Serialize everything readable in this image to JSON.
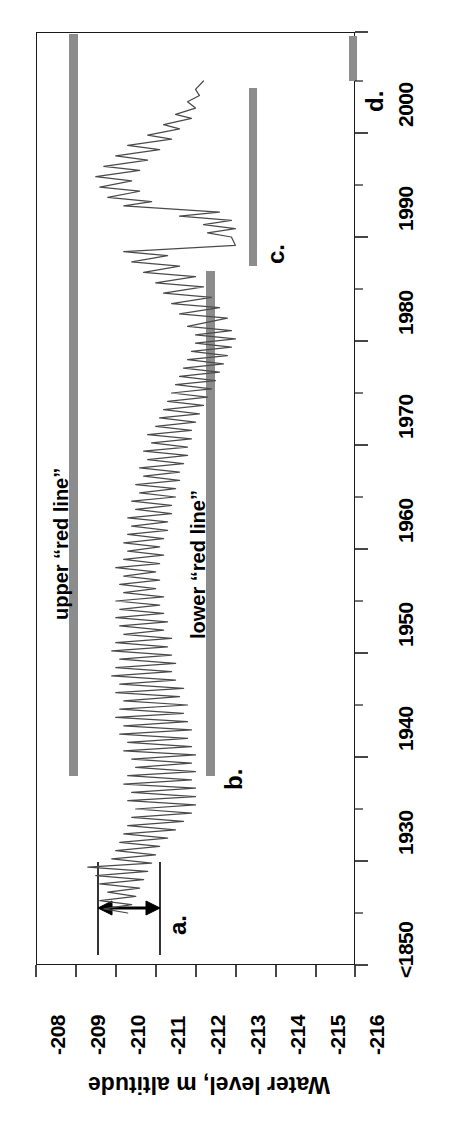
{
  "chart_data": {
    "type": "line",
    "title": "",
    "orientation": "rotated-90-ccw",
    "xlabel": "",
    "ylabel": "Water level, m altitude",
    "x_axis": {
      "name": "year",
      "tick_labels": [
        "<1850",
        "1930",
        "1940",
        "1950",
        "1960",
        "1970",
        "1980",
        "1990",
        "2000"
      ],
      "minor_ticks": true,
      "break_after_first": true
    },
    "y_axis": {
      "name": "Water level, m altitude",
      "tick_labels": [
        "-208",
        "-209",
        "-210",
        "-211",
        "-212",
        "-213",
        "-214",
        "-215",
        "-216"
      ],
      "ylim": [
        -208,
        -216
      ]
    },
    "grid": false,
    "legend": "none",
    "annotations": [
      {
        "key": "a",
        "label": "a.",
        "kind": "double-arrow-span",
        "note": "span marker between two vertical ticks before 1930"
      },
      {
        "key": "b",
        "label": "b.",
        "kind": "bar-end-marker",
        "note": "bottom end of lower red line bar, near 1930"
      },
      {
        "key": "c",
        "label": "c.",
        "kind": "bar-end-marker",
        "note": "bar spanning ~1978 to ~2000"
      },
      {
        "key": "d",
        "label": "d.",
        "kind": "short-bar-marker",
        "note": "short bar at top, after 2000"
      }
    ],
    "series_labels": [
      {
        "id": "upper",
        "text": "upper “red line”",
        "value": -209.0
      },
      {
        "id": "lower",
        "text": "lower “red line”",
        "value": -212.0
      }
    ],
    "series": [
      {
        "name": "Caspian Sea water level",
        "color": "#555555",
        "points": [
          [
            1925.0,
            -210.3
          ],
          [
            1925.4,
            -209.7
          ],
          [
            1925.8,
            -210.4
          ],
          [
            1926.2,
            -209.6
          ],
          [
            1926.6,
            -210.5
          ],
          [
            1927.0,
            -209.8
          ],
          [
            1927.4,
            -210.6
          ],
          [
            1927.8,
            -209.6
          ],
          [
            1928.2,
            -210.7
          ],
          [
            1928.6,
            -209.5
          ],
          [
            1929.0,
            -210.8
          ],
          [
            1929.4,
            -209.3
          ],
          [
            1929.8,
            -210.9
          ],
          [
            1930.2,
            -209.9
          ],
          [
            1930.6,
            -211.0
          ],
          [
            1931.0,
            -210.0
          ],
          [
            1931.4,
            -211.1
          ],
          [
            1931.8,
            -210.1
          ],
          [
            1932.2,
            -211.3
          ],
          [
            1932.6,
            -210.2
          ],
          [
            1933.0,
            -211.5
          ],
          [
            1933.4,
            -210.3
          ],
          [
            1933.8,
            -211.7
          ],
          [
            1934.2,
            -210.4
          ],
          [
            1934.6,
            -211.9
          ],
          [
            1935.0,
            -210.5
          ],
          [
            1935.4,
            -212.0
          ],
          [
            1935.8,
            -210.3
          ],
          [
            1936.2,
            -212.0
          ],
          [
            1936.6,
            -210.4
          ],
          [
            1937.0,
            -212.0
          ],
          [
            1937.4,
            -210.2
          ],
          [
            1937.8,
            -211.9
          ],
          [
            1938.2,
            -210.3
          ],
          [
            1938.6,
            -212.0
          ],
          [
            1939.0,
            -210.5
          ],
          [
            1939.4,
            -211.9
          ],
          [
            1939.8,
            -210.4
          ],
          [
            1940.2,
            -212.0
          ],
          [
            1940.6,
            -210.2
          ],
          [
            1941.0,
            -211.9
          ],
          [
            1941.4,
            -210.3
          ],
          [
            1941.8,
            -211.8
          ],
          [
            1942.2,
            -210.1
          ],
          [
            1942.6,
            -211.9
          ],
          [
            1943.0,
            -210.2
          ],
          [
            1943.4,
            -211.8
          ],
          [
            1943.8,
            -210.0
          ],
          [
            1944.2,
            -211.7
          ],
          [
            1944.6,
            -210.1
          ],
          [
            1945.0,
            -211.8
          ],
          [
            1945.4,
            -210.2
          ],
          [
            1945.8,
            -211.6
          ],
          [
            1946.2,
            -210.0
          ],
          [
            1946.6,
            -211.7
          ],
          [
            1947.0,
            -210.1
          ],
          [
            1947.4,
            -211.5
          ],
          [
            1947.8,
            -209.9
          ],
          [
            1948.2,
            -211.4
          ],
          [
            1948.6,
            -210.0
          ],
          [
            1949.0,
            -211.5
          ],
          [
            1949.4,
            -210.1
          ],
          [
            1949.8,
            -211.4
          ],
          [
            1950.2,
            -209.9
          ],
          [
            1950.6,
            -211.3
          ],
          [
            1951.0,
            -210.0
          ],
          [
            1951.4,
            -211.4
          ],
          [
            1951.8,
            -210.2
          ],
          [
            1952.2,
            -211.2
          ],
          [
            1952.6,
            -210.1
          ],
          [
            1953.0,
            -211.3
          ],
          [
            1953.4,
            -210.0
          ],
          [
            1953.8,
            -211.2
          ],
          [
            1954.2,
            -210.1
          ],
          [
            1954.6,
            -211.1
          ],
          [
            1955.0,
            -210.0
          ],
          [
            1955.4,
            -211.2
          ],
          [
            1955.8,
            -210.2
          ],
          [
            1956.2,
            -211.0
          ],
          [
            1956.6,
            -210.1
          ],
          [
            1957.0,
            -211.1
          ],
          [
            1957.4,
            -210.2
          ],
          [
            1957.8,
            -211.0
          ],
          [
            1958.2,
            -210.0
          ],
          [
            1958.6,
            -211.1
          ],
          [
            1959.0,
            -210.2
          ],
          [
            1959.4,
            -211.2
          ],
          [
            1959.8,
            -210.3
          ],
          [
            1960.2,
            -211.1
          ],
          [
            1960.6,
            -210.2
          ],
          [
            1961.0,
            -211.2
          ],
          [
            1961.4,
            -210.3
          ],
          [
            1961.8,
            -211.3
          ],
          [
            1962.2,
            -210.4
          ],
          [
            1962.6,
            -211.3
          ],
          [
            1963.0,
            -210.3
          ],
          [
            1963.4,
            -211.4
          ],
          [
            1963.8,
            -210.5
          ],
          [
            1964.2,
            -211.4
          ],
          [
            1964.6,
            -210.4
          ],
          [
            1965.0,
            -211.5
          ],
          [
            1965.4,
            -210.6
          ],
          [
            1965.8,
            -211.5
          ],
          [
            1966.2,
            -210.5
          ],
          [
            1966.6,
            -211.6
          ],
          [
            1967.0,
            -210.7
          ],
          [
            1967.4,
            -211.6
          ],
          [
            1967.8,
            -210.6
          ],
          [
            1968.2,
            -211.7
          ],
          [
            1968.6,
            -210.8
          ],
          [
            1969.0,
            -211.8
          ],
          [
            1969.4,
            -210.7
          ],
          [
            1969.8,
            -211.8
          ],
          [
            1970.2,
            -210.9
          ],
          [
            1970.6,
            -211.9
          ],
          [
            1971.0,
            -210.8
          ],
          [
            1971.4,
            -211.9
          ],
          [
            1971.8,
            -211.0
          ],
          [
            1972.2,
            -212.0
          ],
          [
            1972.6,
            -211.1
          ],
          [
            1973.0,
            -212.1
          ],
          [
            1973.4,
            -211.2
          ],
          [
            1973.8,
            -212.2
          ],
          [
            1974.2,
            -211.3
          ],
          [
            1974.6,
            -212.3
          ],
          [
            1975.0,
            -211.4
          ],
          [
            1975.4,
            -212.4
          ],
          [
            1975.8,
            -211.5
          ],
          [
            1976.2,
            -212.5
          ],
          [
            1976.6,
            -211.6
          ],
          [
            1977.0,
            -212.6
          ],
          [
            1977.4,
            -211.7
          ],
          [
            1977.8,
            -212.7
          ],
          [
            1978.2,
            -211.8
          ],
          [
            1978.6,
            -212.8
          ],
          [
            1979.0,
            -211.9
          ],
          [
            1979.4,
            -212.9
          ],
          [
            1979.8,
            -212.0
          ],
          [
            1980.2,
            -213.0
          ],
          [
            1980.6,
            -212.0
          ],
          [
            1981.0,
            -212.9
          ],
          [
            1981.4,
            -211.8
          ],
          [
            1982.2,
            -212.8
          ],
          [
            1982.6,
            -211.6
          ],
          [
            1983.2,
            -212.6
          ],
          [
            1983.6,
            -211.4
          ],
          [
            1984.2,
            -212.4
          ],
          [
            1984.6,
            -211.2
          ],
          [
            1985.2,
            -212.2
          ],
          [
            1985.6,
            -211.0
          ],
          [
            1986.2,
            -212.0
          ],
          [
            1986.6,
            -210.7
          ],
          [
            1987.2,
            -211.6
          ],
          [
            1987.6,
            -210.4
          ],
          [
            1988.2,
            -211.3
          ],
          [
            1988.6,
            -210.2
          ],
          [
            1989.2,
            -213.0
          ],
          [
            1990.0,
            -212.9
          ],
          [
            1990.4,
            -212.3
          ],
          [
            1990.8,
            -213.0
          ],
          [
            1991.2,
            -212.2
          ],
          [
            1991.6,
            -212.9
          ],
          [
            1992.0,
            -211.6
          ],
          [
            1992.4,
            -212.6
          ],
          [
            1993.0,
            -210.2
          ],
          [
            1993.4,
            -210.9
          ],
          [
            1993.8,
            -209.8
          ],
          [
            1994.4,
            -210.6
          ],
          [
            1994.8,
            -209.6
          ],
          [
            1995.4,
            -210.4
          ],
          [
            1995.8,
            -209.5
          ],
          [
            1996.4,
            -210.6
          ],
          [
            1996.8,
            -209.7
          ],
          [
            1997.4,
            -210.8
          ],
          [
            1997.8,
            -210.0
          ],
          [
            1998.4,
            -211.1
          ],
          [
            1998.8,
            -210.3
          ],
          [
            1999.4,
            -211.4
          ],
          [
            1999.8,
            -210.8
          ],
          [
            2000.4,
            -211.6
          ],
          [
            2000.8,
            -211.2
          ],
          [
            2001.4,
            -211.9
          ],
          [
            2001.8,
            -211.5
          ],
          [
            2002.4,
            -212.0
          ],
          [
            2003.0,
            -211.8
          ],
          [
            2003.6,
            -212.1
          ],
          [
            2004.2,
            -212.0
          ],
          [
            2005.0,
            -212.2
          ]
        ]
      }
    ]
  }
}
